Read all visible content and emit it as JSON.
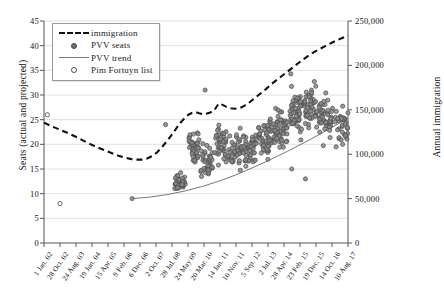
{
  "chart_data": {
    "type": "scatter",
    "title": "",
    "xlabel": "",
    "ylabel": "Seats (actual and projected)",
    "ylabel_right": "Annual immigration",
    "grid": true,
    "legend_position": "top-left",
    "ylim": [
      0,
      45
    ],
    "yticks": [
      "0",
      "5",
      "10",
      "15",
      "20",
      "25",
      "30",
      "35",
      "40",
      "45"
    ],
    "ylim_right": [
      0,
      250000
    ],
    "yticks_right": [
      "0",
      "50,000",
      "100,000",
      "150,000",
      "200,000",
      "250,000"
    ],
    "xticks": [
      "1 Jan. 02",
      "28 Oct. 02",
      "24 Aug. 03",
      "19 Jun. 04",
      "15 Apr. 05",
      "9 Feb. 06",
      "6 Dec. 06",
      "2 Oct. 07",
      "28 Jul. 08",
      "24 May 09",
      "20 Mar. 10",
      "14 Jan. 11",
      "10 Nov. 11",
      "5 Sep. 12",
      "2 Jul. 13",
      "28 Apr. 14",
      "23 Feb. 15",
      "19 Dec. 15",
      "14 Oct. 16",
      "10 Aug. 17"
    ],
    "legend": [
      {
        "label": "immigration",
        "key": "dashed-line",
        "color": "#111111"
      },
      {
        "label": "PVV seats",
        "key": "filled-dot",
        "color": "#6e6e6e"
      },
      {
        "label": "PVV trend",
        "key": "solid-line",
        "color": "#777777"
      },
      {
        "label": "Pim Fortuyn list",
        "key": "open-dot",
        "color": "#555555"
      }
    ],
    "series": [
      {
        "name": "immigration",
        "type": "line",
        "style": "dashed",
        "axis": "right",
        "color": "#111111",
        "points": [
          [
            0.0,
            24.4
          ],
          [
            0.055,
            23.6
          ],
          [
            0.11,
            22.9
          ],
          [
            0.17,
            22.1
          ],
          [
            0.225,
            21.3
          ],
          [
            0.28,
            20.4
          ],
          [
            0.335,
            19.6
          ],
          [
            0.39,
            18.9
          ],
          [
            0.44,
            18.3
          ],
          [
            0.49,
            17.7
          ],
          [
            0.535,
            17.3
          ],
          [
            0.575,
            17.0
          ],
          [
            0.61,
            16.9
          ],
          [
            0.645,
            16.9
          ],
          [
            0.675,
            17.1
          ],
          [
            0.71,
            17.6
          ],
          [
            0.745,
            18.4
          ],
          [
            0.775,
            19.4
          ],
          [
            0.805,
            20.5
          ],
          [
            0.835,
            21.7
          ],
          [
            0.865,
            23.0
          ],
          [
            0.895,
            24.3
          ],
          [
            0.925,
            25.3
          ],
          [
            0.95,
            26.0
          ],
          [
            0.975,
            26.4
          ],
          [
            1.0,
            26.5
          ]
        ]
      },
      {
        "name": "immigration-projected",
        "type": "line",
        "style": "dashed",
        "axis": "right",
        "color": "#111111",
        "points": [
          [
            1.0,
            26.5
          ],
          [
            1.02,
            26.3
          ],
          [
            1.05,
            26.1
          ],
          [
            1.09,
            26.4
          ],
          [
            1.12,
            26.9
          ],
          [
            1.15,
            28.3
          ],
          [
            1.175,
            28.0
          ],
          [
            1.2,
            27.6
          ],
          [
            1.23,
            27.3
          ],
          [
            1.26,
            27.2
          ],
          [
            1.3,
            27.5
          ],
          [
            1.34,
            28.2
          ],
          [
            1.38,
            29.2
          ],
          [
            1.42,
            30.2
          ],
          [
            1.46,
            31.2
          ],
          [
            1.5,
            32.3
          ],
          [
            1.55,
            33.5
          ],
          [
            1.6,
            34.7
          ],
          [
            1.65,
            35.9
          ],
          [
            1.7,
            37.1
          ],
          [
            1.75,
            38.2
          ],
          [
            1.8,
            39.1
          ],
          [
            1.85,
            39.9
          ],
          [
            1.9,
            40.7
          ],
          [
            1.95,
            41.4
          ],
          [
            2.0,
            42.0
          ]
        ]
      },
      {
        "name": "PVV trend",
        "type": "line",
        "style": "solid",
        "axis": "left",
        "color": "#777777",
        "points": [
          [
            0.0,
            9.0
          ],
          [
            0.08,
            9.3
          ],
          [
            0.16,
            9.8
          ],
          [
            0.24,
            10.5
          ],
          [
            0.32,
            11.4
          ],
          [
            0.4,
            12.5
          ],
          [
            0.48,
            13.8
          ],
          [
            0.56,
            15.3
          ],
          [
            0.64,
            16.9
          ],
          [
            0.72,
            18.6
          ],
          [
            0.8,
            20.4
          ],
          [
            0.88,
            22.3
          ],
          [
            0.94,
            23.8
          ],
          [
            1.0,
            25.3
          ]
        ]
      },
      {
        "name": "Pim Fortuyn list",
        "type": "scatter",
        "marker": "open-circle",
        "axis": "left",
        "color": "#555555",
        "points": [
          [
            0.022,
            26.0
          ],
          [
            0.105,
            8.0
          ]
        ]
      },
      {
        "name": "PVV seats",
        "type": "scatter",
        "marker": "filled-circle",
        "axis": "left",
        "color": "#6e6e6e",
        "note": "Dense cloud of poll-projected seats, 2006-2017"
      }
    ]
  }
}
